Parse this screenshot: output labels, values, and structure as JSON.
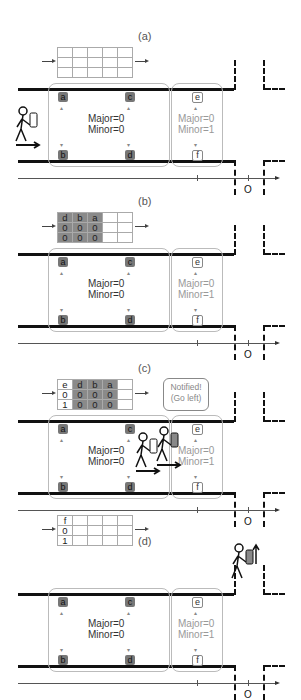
{
  "panels": [
    {
      "label": "(a)",
      "grid": [
        [
          "",
          "",
          "",
          "",
          ""
        ],
        [
          "",
          "",
          "",
          "",
          ""
        ],
        [
          "",
          "",
          "",
          "",
          ""
        ]
      ],
      "filled": [
        [
          0,
          0,
          0,
          0,
          0
        ],
        [
          0,
          0,
          0,
          0,
          0
        ],
        [
          0,
          0,
          0,
          0,
          0
        ]
      ]
    },
    {
      "label": "(b)",
      "grid": [
        [
          "d",
          "b",
          "a",
          "",
          ""
        ],
        [
          "0",
          "0",
          "0",
          "",
          ""
        ],
        [
          "0",
          "0",
          "0",
          "",
          ""
        ]
      ],
      "filled": [
        [
          1,
          1,
          1,
          0,
          0
        ],
        [
          1,
          1,
          1,
          0,
          0
        ],
        [
          1,
          1,
          1,
          0,
          0
        ]
      ]
    },
    {
      "label": "(c)",
      "grid": [
        [
          "e",
          "d",
          "b",
          "a",
          ""
        ],
        [
          "0",
          "0",
          "0",
          "0",
          ""
        ],
        [
          "1",
          "0",
          "0",
          "0",
          ""
        ]
      ],
      "filled": [
        [
          0,
          1,
          1,
          1,
          0
        ],
        [
          0,
          1,
          1,
          1,
          0
        ],
        [
          0,
          1,
          1,
          1,
          0
        ]
      ]
    },
    {
      "label": "(d)",
      "grid": [
        [
          "f",
          "",
          "",
          "",
          ""
        ],
        [
          "0",
          "",
          "",
          "",
          ""
        ],
        [
          "1",
          "",
          "",
          "",
          ""
        ]
      ],
      "filled": [
        [
          0,
          0,
          0,
          0,
          0
        ],
        [
          0,
          0,
          0,
          0,
          0
        ],
        [
          0,
          0,
          0,
          0,
          0
        ]
      ]
    }
  ],
  "zone1": {
    "major": "Major=0",
    "minor": "Minor=0"
  },
  "zone2": {
    "major": "Major=0",
    "minor": "Minor=1"
  },
  "beacons": {
    "a": "a",
    "b": "b",
    "c": "c",
    "d": "d",
    "e": "e",
    "f": "f"
  },
  "origin_label": "O",
  "callout": {
    "line1": "Notified!",
    "line2": "(Go left)"
  },
  "colors": {
    "beacon_active": "#777777",
    "zone_border": "#bbbbbb",
    "wall": "#111111"
  }
}
